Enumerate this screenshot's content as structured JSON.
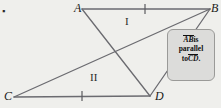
{
  "figure": {
    "type": "geometry-diagram",
    "background_color": "#efefec",
    "stroke_color": "#6b6b70",
    "vertices": [
      {
        "name": "A",
        "label": "A",
        "x": 82,
        "y": 9
      },
      {
        "name": "B",
        "label": "B",
        "x": 210,
        "y": 9
      },
      {
        "name": "C",
        "label": "C",
        "x": 14,
        "y": 97
      },
      {
        "name": "D",
        "label": "D",
        "x": 150,
        "y": 96
      }
    ],
    "segments": [
      {
        "name": "segment-AB",
        "from": "A",
        "to": "B",
        "tick_marks": 1
      },
      {
        "name": "segment-CD",
        "from": "C",
        "to": "D",
        "tick_marks": 1
      },
      {
        "name": "segment-AD",
        "from": "A",
        "to": "D",
        "tick_marks": 0
      },
      {
        "name": "segment-CB",
        "from": "C",
        "to": "B",
        "tick_marks": 0
      },
      {
        "name": "segment-BD",
        "from": "B",
        "to": "D",
        "tick_marks": 0
      }
    ],
    "region_labels": [
      {
        "name": "region-one",
        "label": "I",
        "x": 128,
        "y": 22
      },
      {
        "name": "region-two",
        "label": "II",
        "x": 95,
        "y": 78
      }
    ]
  },
  "callout": {
    "line1_segment": "AB",
    "line1_text": "is",
    "line2_text": "parallel",
    "line3_text": "to",
    "line3_segment": "CD",
    "line3_suffix": ".",
    "full_text": "AB is parallel to CD.",
    "background_color": "#dcdcda",
    "border_color": "#9a9a98"
  },
  "corner_mark": {
    "label": "▪"
  }
}
